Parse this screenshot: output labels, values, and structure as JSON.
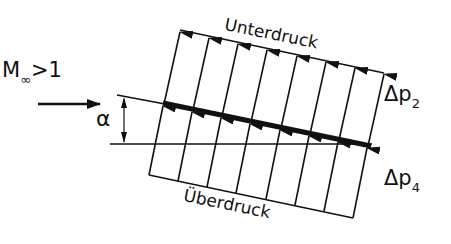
{
  "figure": {
    "type": "supersonic flat plate pressure distribution",
    "labels": {
      "mach_prefix": "M",
      "mach_sub": "∞",
      "mach_suffix": ">1",
      "alpha": "α",
      "upper_side": "Unterdruck",
      "lower_side": "Überdruck",
      "dp_upper_prefix": "Δp",
      "dp_upper_sub": "2",
      "dp_lower_prefix": "Δp",
      "dp_lower_sub": "4"
    },
    "arrow_counts": {
      "upper": 8,
      "lower": 8
    },
    "colors": {
      "ink": "#111111",
      "background": "#ffffff"
    }
  }
}
